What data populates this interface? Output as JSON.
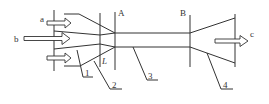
{
  "diagram": {
    "type": "ejector-mixing-tube-schematic",
    "inlets": [
      {
        "label": "a",
        "position": "upper"
      },
      {
        "label": "b",
        "position": "center"
      },
      {
        "label": "",
        "position": "lower"
      }
    ],
    "outlet": {
      "label": "c"
    },
    "sections": [
      {
        "label": "A"
      },
      {
        "label": "B"
      }
    ],
    "length_label": "L",
    "parts": [
      {
        "number": "1"
      },
      {
        "number": "2"
      },
      {
        "number": "3"
      },
      {
        "number": "4"
      }
    ]
  }
}
